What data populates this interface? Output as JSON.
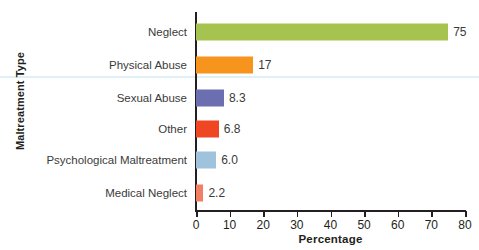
{
  "chart_data": {
    "type": "bar",
    "orientation": "horizontal",
    "title": "",
    "xlabel": "Percentage",
    "ylabel": "Maltreatment Type",
    "xlim": [
      0,
      80
    ],
    "xticks": [
      0,
      10,
      20,
      30,
      40,
      50,
      60,
      70,
      80
    ],
    "xtick_labels": [
      "0",
      "10",
      "20",
      "30",
      "40",
      "50",
      "60",
      "70",
      "80"
    ],
    "grid": false,
    "legend": "none",
    "categories": [
      "Neglect",
      "Physical Abuse",
      "Sexual Abuse",
      "Other",
      "Psychological Maltreatment",
      "Medical Neglect"
    ],
    "values": [
      75,
      17,
      8.3,
      6.8,
      6.0,
      2.2
    ],
    "value_labels": [
      "75",
      "17",
      "8.3",
      "6.8",
      "6.0",
      "2.2"
    ],
    "bar_colors": [
      "#a6c34f",
      "#f7941e",
      "#6b6fb0",
      "#ef4623",
      "#9fc3dd",
      "#f07f63"
    ],
    "axis_color": "#231f20",
    "background_color": "#ffffff",
    "label_text_color": "#3b3b3b"
  }
}
